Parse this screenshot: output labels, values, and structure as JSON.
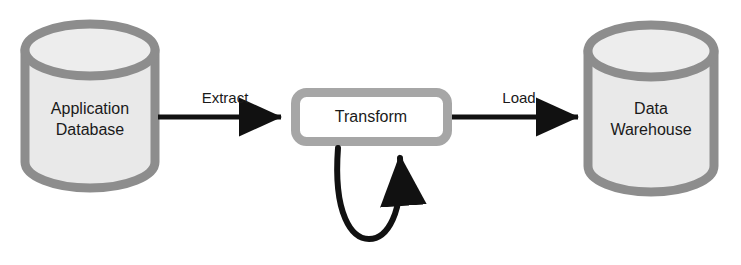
{
  "diagram": {
    "type": "flow-diagram",
    "canvas": {
      "width": 741,
      "height": 265,
      "background": "#ffffff"
    },
    "colors": {
      "cylinder_stroke": "#8d8d8d",
      "cylinder_fill": "#e9e9e9",
      "cylinder_top_fill": "#ededed",
      "box_stroke": "#a6a6a6",
      "box_fill": "#ffffff",
      "arrow": "#111111",
      "text": "#1a1a1a"
    },
    "nodes": [
      {
        "id": "application-database",
        "shape": "cylinder",
        "label_line1": "Application",
        "label_line2": "Database",
        "x": 20,
        "y": 22,
        "width": 140,
        "height": 168
      },
      {
        "id": "transform",
        "shape": "rounded-rectangle",
        "label_line1": "Transform",
        "label_line2": "",
        "x": 291,
        "y": 88,
        "width": 161,
        "height": 58
      },
      {
        "id": "data-warehouse",
        "shape": "cylinder",
        "label_line1": "Data",
        "label_line2": "Warehouse",
        "x": 583,
        "y": 22,
        "width": 136,
        "height": 172
      }
    ],
    "edges": [
      {
        "id": "extract",
        "label": "Extract",
        "from": "application-database",
        "to": "transform",
        "label_x": 225,
        "label_y": 103
      },
      {
        "id": "load",
        "label": "Load",
        "from": "transform",
        "to": "data-warehouse",
        "label_x": 519,
        "label_y": 103
      },
      {
        "id": "transform-self-loop",
        "label": "",
        "from": "transform",
        "to": "transform",
        "label_x": 0,
        "label_y": 0
      }
    ]
  }
}
